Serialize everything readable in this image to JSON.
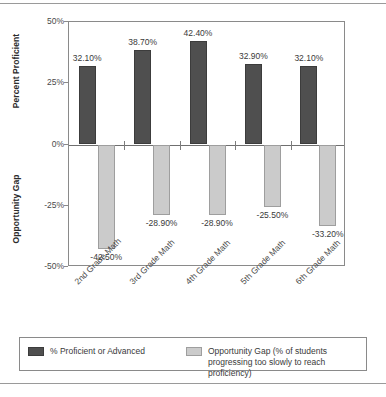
{
  "chart_data": {
    "type": "bar",
    "title": "",
    "xlabel": "",
    "ylabel_top": "Percent Proficient",
    "ylabel_bottom": "Opportunity Gap",
    "ylim": [
      -50,
      50
    ],
    "yticks": [
      "50%",
      "25%",
      "0%",
      "-25%",
      "-50%"
    ],
    "ytick_values": [
      50,
      25,
      0,
      -25,
      -50
    ],
    "grid": false,
    "legend_position": "bottom",
    "categories": [
      "2nd Grade Math",
      "3rd Grade Math",
      "4th Grade Math",
      "5th Grade Math",
      "6th Grade Math"
    ],
    "series": [
      {
        "name": "% Proficient or Advanced",
        "color": "#4f4f4f",
        "values": [
          32.1,
          38.7,
          42.4,
          32.9,
          32.1
        ],
        "labels": [
          "32.10%",
          "38.70%",
          "42.40%",
          "32.90%",
          "32.10%"
        ]
      },
      {
        "name": "Opportunity Gap (% of students\nprogressing too slowly to reach proficiency)",
        "color": "#cbcbcb",
        "values": [
          -42.5,
          -28.9,
          -28.9,
          -25.5,
          -33.2
        ],
        "labels": [
          "-42.50%",
          "-28.90%",
          "-28.90%",
          "-25.50%",
          "-33.20%"
        ]
      }
    ]
  },
  "legend": {
    "items": [
      {
        "label": "% Proficient or Advanced"
      },
      {
        "label": "Opportunity Gap (% of students\nprogressing too slowly to reach proficiency)"
      }
    ]
  }
}
